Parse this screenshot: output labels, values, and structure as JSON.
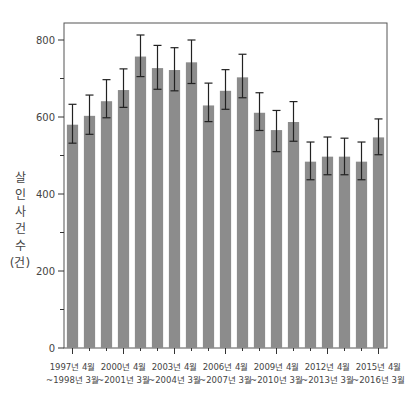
{
  "chart_data": {
    "type": "bar",
    "title": "",
    "xlabel": "",
    "ylabel": "살인 사건 수 (건)",
    "ylabel_chars": [
      "살",
      "인",
      "사",
      "건",
      "수",
      "(건)"
    ],
    "ylim": [
      0,
      840
    ],
    "yticks_major": [
      0,
      200,
      400,
      600,
      800
    ],
    "yticks_minor": [
      100,
      300,
      500,
      700
    ],
    "grid": false,
    "legend": null,
    "error_bars": true,
    "bar_color": "#8c8c8c",
    "categories": [
      "1997년 4월~1998년 3월",
      "1998년 4월~1999년 3월",
      "1999년 4월~2000년 3월",
      "2000년 4월~2001년 3월",
      "2001년 4월~2002년 3월",
      "2002년 4월~2003년 3월",
      "2003년 4월~2004년 3월",
      "2004년 4월~2005년 3월",
      "2005년 4월~2006년 3월",
      "2006년 4월~2007년 3월",
      "2007년 4월~2008년 3월",
      "2008년 4월~2009년 3월",
      "2009년 4월~2010년 3월",
      "2010년 4월~2011년 3월",
      "2011년 4월~2012년 3월",
      "2012년 4월~2013년 3월",
      "2013년 4월~2014년 3월",
      "2014년 4월~2015년 3월",
      "2015년 4월~2016년 3월"
    ],
    "values": [
      580,
      603,
      641,
      670,
      757,
      727,
      722,
      742,
      630,
      668,
      703,
      611,
      566,
      587,
      484,
      497,
      497,
      484,
      547
    ],
    "err_low": [
      532,
      555,
      598,
      625,
      705,
      672,
      668,
      687,
      588,
      620,
      650,
      565,
      510,
      537,
      437,
      450,
      450,
      437,
      502
    ],
    "err_high": [
      633,
      657,
      697,
      725,
      813,
      786,
      780,
      800,
      688,
      723,
      763,
      663,
      617,
      640,
      535,
      548,
      545,
      535,
      595
    ],
    "x_tick_labels": [
      {
        "index": 0,
        "line1": "1997년 4월",
        "line2": "~1998년 3월"
      },
      {
        "index": 3,
        "line1": "2000년 4월",
        "line2": "~2001년 3월"
      },
      {
        "index": 6,
        "line1": "2003년 4월",
        "line2": "~2004년 3월"
      },
      {
        "index": 9,
        "line1": "2006년 4월",
        "line2": "~2007년 3월"
      },
      {
        "index": 12,
        "line1": "2009년 4월",
        "line2": "~2010년 3월"
      },
      {
        "index": 15,
        "line1": "2012년 4월",
        "line2": "~2013년 3월"
      },
      {
        "index": 18,
        "line1": "2015년 4월",
        "line2": "~2016년 3월"
      }
    ]
  }
}
